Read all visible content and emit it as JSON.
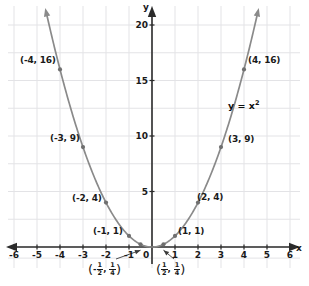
{
  "chart_data": {
    "type": "line",
    "title": "",
    "equation_label": "y = x",
    "equation_exponent": "2",
    "xlabel": "x",
    "ylabel": "y",
    "xlim": [
      -6.5,
      6.5
    ],
    "ylim": [
      -1.5,
      20.8
    ],
    "xticks": [
      "-6",
      "-5",
      "-4",
      "-3",
      "-2",
      "-1",
      "1",
      "2",
      "3",
      "4",
      "5",
      "6"
    ],
    "xtick_values": [
      -6,
      -5,
      -4,
      -3,
      -2,
      -1,
      1,
      2,
      3,
      4,
      5,
      6
    ],
    "yticks": [
      "5",
      "10",
      "15",
      "20"
    ],
    "ytick_values": [
      5,
      10,
      15,
      20
    ],
    "origin_label": "0",
    "grid": true,
    "curve_color": "#8a8a8a",
    "axis_color": "#2b2b2b",
    "grid_color": "#e3e3e6",
    "x": [
      -4.55,
      -4,
      -3,
      -2,
      -1,
      -0.5,
      0,
      0.5,
      1,
      2,
      3,
      4,
      4.55
    ],
    "y": [
      20.7,
      16,
      9,
      4,
      1,
      0.25,
      0,
      0.25,
      1,
      4,
      9,
      16,
      20.7
    ],
    "points": [
      {
        "name": "point-neg4-16",
        "x": -4,
        "y": 16,
        "label": "(-4, 16)",
        "label_side": "left"
      },
      {
        "name": "point-neg3-9",
        "x": -3,
        "y": 9,
        "label": "(-3, 9)",
        "label_side": "left"
      },
      {
        "name": "point-neg2-4",
        "x": -2,
        "y": 4,
        "label": "(-2, 4)",
        "label_side": "left"
      },
      {
        "name": "point-neg1-1",
        "x": -1,
        "y": 1,
        "label": "(-1, 1)",
        "label_side": "left"
      },
      {
        "name": "point-neghalf-quarter",
        "x": -0.5,
        "y": 0.25,
        "label": "",
        "label_side": "below"
      },
      {
        "name": "point-half-quarter",
        "x": 0.5,
        "y": 0.25,
        "label": "",
        "label_side": "below"
      },
      {
        "name": "point-1-1",
        "x": 1,
        "y": 1,
        "label": "(1, 1)",
        "label_side": "right"
      },
      {
        "name": "point-2-4",
        "x": 2,
        "y": 4,
        "label": "(2, 4)",
        "label_side": "right"
      },
      {
        "name": "point-3-9",
        "x": 3,
        "y": 9,
        "label": "(3, 9)",
        "label_side": "right"
      },
      {
        "name": "point-4-16",
        "x": 4,
        "y": 16,
        "label": "(4, 16)",
        "label_side": "right"
      }
    ],
    "fraction_annotations": [
      {
        "name": "fraction-label-negative-half",
        "sign": "-",
        "num1": "1",
        "den1": "2",
        "num2": "1",
        "den2": "4",
        "separator": ","
      },
      {
        "name": "fraction-label-positive-half",
        "sign": "",
        "num1": "1",
        "den1": "2",
        "num2": "1",
        "den2": "4",
        "separator": ","
      }
    ]
  }
}
